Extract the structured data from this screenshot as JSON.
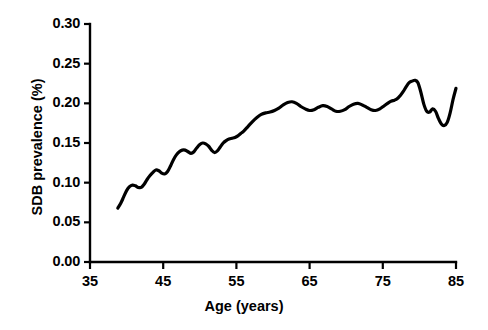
{
  "chart_data": {
    "type": "line",
    "title": "",
    "xlabel": "Age (years)",
    "ylabel": "SDB prevalence (%)",
    "xlim": [
      35,
      85
    ],
    "ylim": [
      0.0,
      0.3
    ],
    "xticks": [
      "35",
      "45",
      "55",
      "65",
      "75",
      "85"
    ],
    "xtick_values": [
      35,
      45,
      55,
      65,
      75,
      85
    ],
    "yticks": [
      "0.00",
      "0.05",
      "0.10",
      "0.15",
      "0.20",
      "0.25",
      "0.30"
    ],
    "ytick_values": [
      0.0,
      0.05,
      0.1,
      0.15,
      0.2,
      0.25,
      0.3
    ],
    "grid": false,
    "legend": false,
    "line_color": "#000000",
    "line_width": 3.2,
    "axis_color": "#000000",
    "background": "#ffffff",
    "series": [
      {
        "name": "SDB prevalence",
        "x": [
          38.8,
          39.2,
          39.6,
          40.0,
          40.4,
          40.8,
          41.2,
          41.6,
          42.0,
          42.4,
          42.8,
          43.2,
          43.6,
          44.0,
          44.4,
          44.8,
          45.2,
          45.6,
          46.0,
          46.4,
          46.8,
          47.2,
          47.6,
          48.0,
          48.4,
          48.8,
          49.2,
          49.6,
          50.0,
          50.4,
          50.8,
          51.2,
          51.6,
          52.0,
          52.4,
          52.8,
          53.2,
          53.6,
          54.0,
          54.4,
          54.8,
          55.2,
          55.6,
          56.0,
          56.6,
          57.2,
          57.8,
          58.4,
          59.0,
          59.6,
          60.2,
          60.8,
          61.4,
          62.0,
          62.6,
          63.2,
          63.8,
          64.4,
          65.0,
          65.6,
          66.2,
          66.8,
          67.4,
          68.0,
          68.6,
          69.2,
          69.8,
          70.4,
          71.0,
          71.6,
          72.2,
          72.8,
          73.4,
          74.0,
          74.6,
          75.2,
          75.8,
          76.2,
          76.6,
          77.0,
          77.4,
          77.8,
          78.2,
          78.6,
          79.0,
          79.4,
          79.8,
          80.2,
          80.6,
          81.0,
          81.4,
          81.8,
          82.2,
          82.6,
          83.0,
          83.4,
          83.8,
          84.2,
          84.6,
          85.0
        ],
        "y": [
          0.068,
          0.074,
          0.082,
          0.09,
          0.095,
          0.097,
          0.096,
          0.094,
          0.094,
          0.098,
          0.104,
          0.109,
          0.113,
          0.116,
          0.115,
          0.112,
          0.111,
          0.114,
          0.121,
          0.129,
          0.135,
          0.139,
          0.141,
          0.141,
          0.139,
          0.137,
          0.139,
          0.144,
          0.148,
          0.15,
          0.149,
          0.146,
          0.141,
          0.138,
          0.14,
          0.145,
          0.15,
          0.153,
          0.155,
          0.156,
          0.157,
          0.159,
          0.162,
          0.165,
          0.171,
          0.177,
          0.182,
          0.186,
          0.188,
          0.189,
          0.191,
          0.194,
          0.198,
          0.201,
          0.202,
          0.2,
          0.196,
          0.193,
          0.191,
          0.192,
          0.195,
          0.197,
          0.196,
          0.193,
          0.19,
          0.19,
          0.192,
          0.196,
          0.199,
          0.2,
          0.198,
          0.195,
          0.192,
          0.191,
          0.193,
          0.197,
          0.201,
          0.203,
          0.204,
          0.206,
          0.21,
          0.215,
          0.221,
          0.226,
          0.228,
          0.229,
          0.226,
          0.214,
          0.199,
          0.19,
          0.189,
          0.193,
          0.19,
          0.181,
          0.174,
          0.172,
          0.176,
          0.188,
          0.205,
          0.219
        ]
      }
    ],
    "annotations": []
  },
  "axes": {
    "y_title": "SDB prevalence (%)",
    "x_title": "Age (years)",
    "y_tick_labels": [
      "0.30",
      "0.25",
      "0.20",
      "0.15",
      "0.10",
      "0.05",
      "0.00"
    ],
    "x_tick_labels": [
      "35",
      "45",
      "55",
      "65",
      "75",
      "85"
    ]
  }
}
